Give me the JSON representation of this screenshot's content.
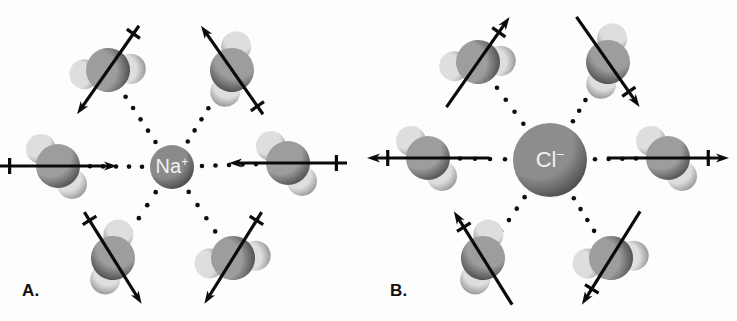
{
  "figure": {
    "type": "diagram",
    "background_color": "#ffffff",
    "ink_color": "#0a0a0a",
    "width": 737,
    "height": 321
  },
  "panels": [
    {
      "id": "A",
      "label": "A.",
      "label_x": 22,
      "label_y": 281,
      "ion": {
        "symbol": "Na",
        "charge": "+",
        "full_label": "Na+",
        "name": "sodium-cation",
        "cx": 172,
        "cy": 167,
        "r": 22,
        "fill_center": "#8a8a8a",
        "fill_edge": "#3a3a3a",
        "text_color": "#f2f2f2",
        "font_size": 20
      },
      "dipole_direction": "inward",
      "waters": [
        {
          "name": "water-top-left",
          "cx": 108,
          "cy": 70,
          "angle": 125,
          "tilt": -55,
          "arrow_len": 108,
          "cross_at": "tail"
        },
        {
          "name": "water-top-right",
          "cx": 232,
          "cy": 70,
          "angle": 235,
          "tilt": 55,
          "arrow_len": 108,
          "cross_at": "tail"
        },
        {
          "name": "water-left",
          "cx": 58,
          "cy": 166,
          "angle": 0,
          "tilt": 0,
          "arrow_len": 118,
          "cross_at": "tail"
        },
        {
          "name": "water-right",
          "cx": 288,
          "cy": 163,
          "angle": 180,
          "tilt": 0,
          "arrow_len": 118,
          "cross_at": "tail"
        },
        {
          "name": "water-bottom-left",
          "cx": 113,
          "cy": 258,
          "angle": 58,
          "tilt": 58,
          "arrow_len": 108,
          "cross_at": "tail"
        },
        {
          "name": "water-bottom-right",
          "cx": 233,
          "cy": 258,
          "angle": 122,
          "tilt": -58,
          "arrow_len": 108,
          "cross_at": "tail"
        }
      ]
    },
    {
      "id": "B",
      "label": "B.",
      "label_x": 22,
      "label_y": 281,
      "ion": {
        "symbol": "Cl",
        "charge": "−",
        "full_label": "Cl-",
        "name": "chloride-anion",
        "cx": 182,
        "cy": 160,
        "r": 37,
        "fill_center": "#8d8d8d",
        "fill_edge": "#3d3d3d",
        "text_color": "#f2f2f2",
        "font_size": 22
      },
      "dipole_direction": "outward",
      "waters": [
        {
          "name": "water-top-left",
          "cx": 110,
          "cy": 62,
          "angle": -55,
          "tilt": -55,
          "arrow_len": 110,
          "cross_at": "head"
        },
        {
          "name": "water-top-right",
          "cx": 240,
          "cy": 62,
          "angle": 55,
          "tilt": 55,
          "arrow_len": 110,
          "cross_at": "head"
        },
        {
          "name": "water-left",
          "cx": 60,
          "cy": 158,
          "angle": 180,
          "tilt": 0,
          "arrow_len": 122,
          "cross_at": "head"
        },
        {
          "name": "water-right",
          "cx": 300,
          "cy": 158,
          "angle": 0,
          "tilt": 0,
          "arrow_len": 122,
          "cross_at": "head"
        },
        {
          "name": "water-bottom-left",
          "cx": 115,
          "cy": 258,
          "angle": -122,
          "tilt": 58,
          "arrow_len": 110,
          "cross_at": "head"
        },
        {
          "name": "water-bottom-right",
          "cx": 243,
          "cy": 258,
          "angle": 122,
          "tilt": -58,
          "arrow_len": 110,
          "cross_at": "head"
        }
      ]
    }
  ],
  "molecule": {
    "name": "water",
    "formula": "H2O",
    "oxygen": {
      "r": 22,
      "fill_center": "#9d9d9d",
      "fill_edge": "#3f3f3f"
    },
    "hydrogen": {
      "r": 15,
      "fill_center": "#dedede",
      "fill_edge": "#8a8a8a"
    },
    "hydrogen_offsets": [
      {
        "dx": -17,
        "dy": -17
      },
      {
        "dx": 14,
        "dy": 18
      }
    ]
  },
  "dotted_line": {
    "name": "ion-dipole-interaction",
    "dot_radius": 2.3,
    "dot_spacing": 12,
    "color": "#0d0d0d"
  },
  "dipole_arrow": {
    "name": "dipole-moment-vector",
    "stroke_width": 3.2,
    "head_length": 13,
    "head_width": 9,
    "crossbar_length": 16,
    "crossbar_stroke": 3.2,
    "color": "#0a0a0a"
  }
}
